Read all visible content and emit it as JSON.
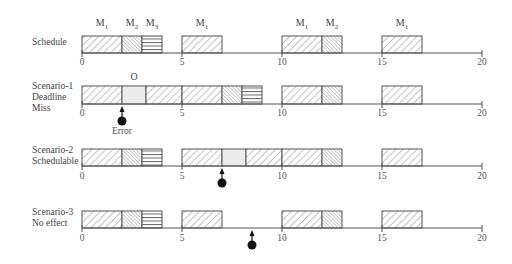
{
  "chart_data": {
    "type": "timeline",
    "title": "",
    "axis": {
      "min": 0,
      "max": 20,
      "ticks": [
        0,
        5,
        10,
        15,
        20
      ]
    },
    "legend": {
      "M1": "diagonal hatch (wide)",
      "M2": "diagonal hatch (dense)",
      "M3": "horizontal lines",
      "O": "light gray fill"
    },
    "rows": [
      {
        "label_lines": [
          "Schedule"
        ],
        "top_labels": [
          {
            "text": "M",
            "sub": "1",
            "x": 1
          },
          {
            "text": "M",
            "sub": "2",
            "x": 2.5
          },
          {
            "text": "M",
            "sub": "3",
            "x": 3.5
          },
          {
            "text": "M",
            "sub": "1",
            "x": 6
          },
          {
            "text": "M",
            "sub": "1",
            "x": 11
          },
          {
            "text": "M",
            "sub": "2",
            "x": 12.5
          },
          {
            "text": "M",
            "sub": "1",
            "x": 16
          }
        ],
        "blocks": [
          {
            "task": "M1",
            "start": 0,
            "end": 2
          },
          {
            "task": "M2",
            "start": 2,
            "end": 3
          },
          {
            "task": "M3",
            "start": 3,
            "end": 4
          },
          {
            "task": "M1",
            "start": 5,
            "end": 7
          },
          {
            "task": "M1",
            "start": 10,
            "end": 12
          },
          {
            "task": "M2",
            "start": 12,
            "end": 13
          },
          {
            "task": "M1",
            "start": 15,
            "end": 17
          }
        ],
        "error_at": null
      },
      {
        "label_lines": [
          "Scenario-1",
          "Deadline",
          "Miss"
        ],
        "top_labels": [
          {
            "text": "O",
            "sub": "",
            "x": 2.6
          }
        ],
        "blocks": [
          {
            "task": "M1",
            "start": 0,
            "end": 2
          },
          {
            "task": "O",
            "start": 2,
            "end": 3.2
          },
          {
            "task": "M1",
            "start": 3.2,
            "end": 5
          },
          {
            "task": "M1",
            "start": 5,
            "end": 7
          },
          {
            "task": "M2",
            "start": 7,
            "end": 8
          },
          {
            "task": "M3",
            "start": 8,
            "end": 9
          },
          {
            "task": "M1",
            "start": 10,
            "end": 12
          },
          {
            "task": "M2",
            "start": 12,
            "end": 13
          },
          {
            "task": "M1",
            "start": 15,
            "end": 17
          }
        ],
        "error_at": 2,
        "error_label": "Error"
      },
      {
        "label_lines": [
          "Scenario-2",
          "Schedulable"
        ],
        "top_labels": [],
        "blocks": [
          {
            "task": "M1",
            "start": 0,
            "end": 2
          },
          {
            "task": "M2",
            "start": 2,
            "end": 3
          },
          {
            "task": "M3",
            "start": 3,
            "end": 4
          },
          {
            "task": "M1",
            "start": 5,
            "end": 7
          },
          {
            "task": "O",
            "start": 7,
            "end": 8.2
          },
          {
            "task": "M1",
            "start": 8.2,
            "end": 10
          },
          {
            "task": "M1",
            "start": 10,
            "end": 12
          },
          {
            "task": "M2",
            "start": 12,
            "end": 13
          },
          {
            "task": "M1",
            "start": 15,
            "end": 17
          }
        ],
        "error_at": 7,
        "error_label": ""
      },
      {
        "label_lines": [
          "Scenario-3",
          "No effect"
        ],
        "top_labels": [],
        "blocks": [
          {
            "task": "M1",
            "start": 0,
            "end": 2
          },
          {
            "task": "M2",
            "start": 2,
            "end": 3
          },
          {
            "task": "M3",
            "start": 3,
            "end": 4
          },
          {
            "task": "M1",
            "start": 5,
            "end": 7
          },
          {
            "task": "M1",
            "start": 10,
            "end": 12
          },
          {
            "task": "M2",
            "start": 12,
            "end": 13
          },
          {
            "task": "M1",
            "start": 15,
            "end": 17
          }
        ],
        "error_at": 8.5,
        "error_label": ""
      }
    ]
  },
  "layout": {
    "x0": 82,
    "px_per_unit": 20,
    "rows": [
      {
        "block_top": 36,
        "axis_y": 53,
        "label_top": 37,
        "tick_label_top": 57,
        "top_label_y": 17
      },
      {
        "block_top": 86,
        "axis_y": 104,
        "label_top": 81,
        "tick_label_top": 108,
        "top_label_y": 71
      },
      {
        "block_top": 149,
        "axis_y": 166,
        "label_top": 145,
        "tick_label_top": 171,
        "top_label_y": 0
      },
      {
        "block_top": 211,
        "axis_y": 228,
        "label_top": 207,
        "tick_label_top": 233,
        "top_label_y": 0
      }
    ]
  },
  "colors": {
    "line": "#555555",
    "hatch": "#8a8a8a",
    "fill_o": "#ececec",
    "marker": "#111111"
  }
}
